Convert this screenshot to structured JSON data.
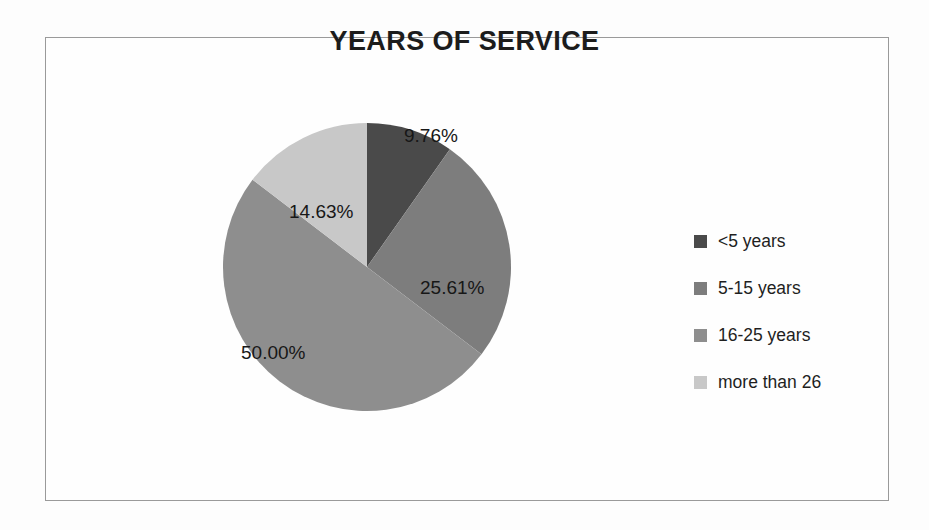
{
  "chart_data": {
    "type": "pie",
    "title": "YEARS OF SERVICE",
    "categories": [
      "<5 years",
      "5-15 years",
      "16-25 years",
      "more than 26"
    ],
    "values": [
      9.76,
      25.61,
      50.0,
      14.63
    ],
    "value_labels": [
      "9.76%",
      "25.61%",
      "50.00%",
      "14.63%"
    ],
    "unit": "percent",
    "start_angle_deg": 0,
    "direction": "clockwise",
    "legend_position": "right",
    "grid": false,
    "xlabel": "",
    "ylabel": "",
    "colors": [
      "#4a4a4a",
      "#7d7d7d",
      "#8e8e8e",
      "#c8c8c8"
    ],
    "label_color": "#171717",
    "frame_color": "#9a9a9a",
    "background": "#fdfdfd"
  },
  "legend": {
    "items": [
      {
        "label": "<5 years",
        "color": "#4a4a4a"
      },
      {
        "label": "5-15 years",
        "color": "#7d7d7d"
      },
      {
        "label": "16-25 years",
        "color": "#8e8e8e"
      },
      {
        "label": "more than 26",
        "color": "#c8c8c8"
      }
    ]
  }
}
